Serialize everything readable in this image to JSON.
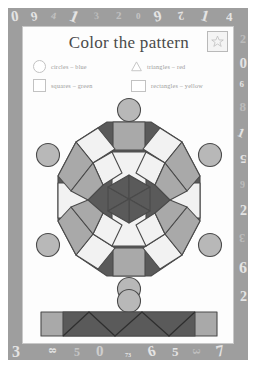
{
  "page": {
    "title": "Color the pattern",
    "page_number": "73",
    "star_icon": "star-icon",
    "frame_color": "#9e9e9e",
    "sheet_color": "#fdfdfd"
  },
  "legend": {
    "items": [
      {
        "shape": "circle",
        "icon": "circle-swatch-icon",
        "text": "circles – blue",
        "color_name": "blue"
      },
      {
        "shape": "triangle",
        "icon": "triangle-swatch-icon",
        "text": "triangles – red",
        "color_name": "red"
      },
      {
        "shape": "square",
        "icon": "square-swatch-icon",
        "text": "squares – green",
        "color_name": "green"
      },
      {
        "shape": "rectangle",
        "icon": "rectangle-swatch-icon",
        "text": "rectangles – yellow",
        "color_name": "yellow"
      }
    ]
  },
  "pattern": {
    "name": "mandala",
    "circles_count": 6,
    "fill_white": "#f2f2f2",
    "fill_light_gray": "#a9a9a9",
    "fill_dark_gray": "#5a5a5a",
    "fill_circle": "#b8b8b8",
    "stroke": "#4a4a4a"
  },
  "bottom_bar": {
    "name": "zigzag-strip",
    "triangles": 5,
    "circle_above": true
  },
  "border_numbers": {
    "top": [
      "0",
      "6",
      "4",
      "1",
      "3",
      "2",
      "0",
      "9",
      "2",
      "1",
      "4"
    ],
    "right": [
      "2",
      "0",
      "6",
      "8",
      "1",
      "5",
      "9",
      "2",
      "3",
      "6",
      "2"
    ],
    "bottom": [
      "3",
      "8",
      "5",
      "0",
      "6",
      "5",
      "3",
      "7"
    ],
    "left": []
  }
}
